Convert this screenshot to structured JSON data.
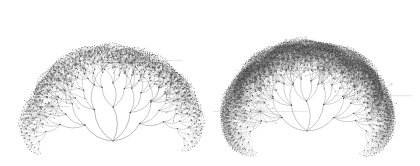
{
  "page": {
    "background_color": "#ffffff",
    "width": 420,
    "height": 166,
    "has_text_labels": false
  },
  "figures": [
    {
      "name": "left-tree",
      "caption": "",
      "panel": {
        "x": 0,
        "y": 0,
        "width": 210,
        "height": 166
      },
      "root": {
        "x": 113,
        "y": 141
      },
      "hub": {
        "x": 116,
        "y": 63
      },
      "bounds": {
        "left": 22,
        "right": 205,
        "top": 9,
        "bottom": 141
      },
      "branching_factor": 3,
      "depth": 6,
      "root_fan_count": 5,
      "root_fan_spread_deg": 116,
      "child_spread_deg": 60,
      "first_edge_length": 34,
      "length_decay": 0.69,
      "edge_curvature": 0.26,
      "stroke_color": "#5a5a5a",
      "stroke_width": 0.42,
      "node_color": "#3c3c3c",
      "node_radius": 0.75,
      "spoke_hubs": 9,
      "spoke_count": 12
    },
    {
      "name": "right-tree",
      "caption": "",
      "panel": {
        "x": 210,
        "y": 0,
        "width": 210,
        "height": 166
      },
      "root": {
        "x": 97,
        "y": 131
      },
      "hub": {
        "x": 97,
        "y": 62
      },
      "bounds": {
        "left": 8,
        "right": 192,
        "top": 8,
        "bottom": 131
      },
      "branching_factor": 4,
      "depth": 6,
      "root_fan_count": 5,
      "root_fan_spread_deg": 122,
      "child_spread_deg": 72,
      "first_edge_length": 30,
      "length_decay": 0.72,
      "edge_curvature": 0.24,
      "stroke_color": "#646464",
      "stroke_width": 0.38,
      "node_color": "#414141",
      "node_radius": 0.7,
      "spoke_hubs": 13,
      "spoke_count": 14
    }
  ],
  "chart_data": {
    "type": "diagram",
    "diagram_kind": "hyperbolic-tree-embedding",
    "title": "",
    "panels": 2,
    "series": [
      {
        "name": "left-tree",
        "branching_factor": 3,
        "depth": 6,
        "approx_node_count": 365
      },
      {
        "name": "right-tree",
        "branching_factor": 4,
        "depth": 6,
        "approx_node_count": 745
      }
    ],
    "legend": [],
    "xlabel": "",
    "ylabel": "",
    "grid": false
  }
}
